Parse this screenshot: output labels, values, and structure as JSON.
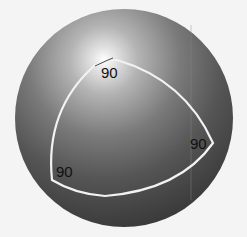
{
  "diagram": {
    "sphere": {
      "cx": 124,
      "cy": 118,
      "r": 109,
      "highlight": {
        "cx": 104,
        "cy": 60
      },
      "shade_light": "#ffffff",
      "shade_dark": "#3a3a3a"
    },
    "triangle": {
      "stroke": "#f2f2f2"
    },
    "vertices": [
      {
        "name": "top",
        "angle_label": "90"
      },
      {
        "name": "right",
        "angle_label": "90"
      },
      {
        "name": "left",
        "angle_label": "90"
      }
    ],
    "background": "#f4f4f4"
  }
}
